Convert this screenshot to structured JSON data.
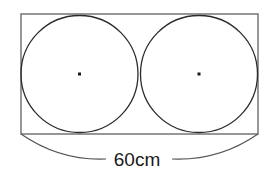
{
  "figure": {
    "background_color": "#ffffff",
    "rectangle": {
      "name": "outer-rectangle",
      "x": 21,
      "y": 14,
      "width": 237,
      "height": 120,
      "stroke_color": "#6b6b6b",
      "stroke_width": 1.4,
      "fill": "none"
    },
    "circles": [
      {
        "name": "left-circle",
        "cx": 79.5,
        "cy": 74,
        "r": 58.5,
        "stroke_color": "#2b2b2b",
        "stroke_width": 1.3,
        "fill": "none"
      },
      {
        "name": "right-circle",
        "cx": 199,
        "cy": 74,
        "r": 58.5,
        "stroke_color": "#2b2b2b",
        "stroke_width": 1.3,
        "fill": "none"
      }
    ],
    "center_dots": [
      {
        "name": "left-circle-center-dot",
        "cx": 79.5,
        "cy": 74,
        "size": 3,
        "color": "#1a1a1a"
      },
      {
        "name": "right-circle-center-dot",
        "cx": 199,
        "cy": 74,
        "size": 3,
        "color": "#1a1a1a"
      }
    ],
    "dimension": {
      "name": "width-dimension",
      "label": "60cm",
      "label_x": 137,
      "label_y": 166,
      "stroke_color": "#555555",
      "stroke_width": 1.2,
      "left_path": "M 21 134 Q 60 161 106 159",
      "right_path": "M 258 134 Q 219 161 172 159"
    }
  },
  "measurements": {
    "stated_total_width": "60cm",
    "circle_count": 2,
    "units": "cm"
  }
}
